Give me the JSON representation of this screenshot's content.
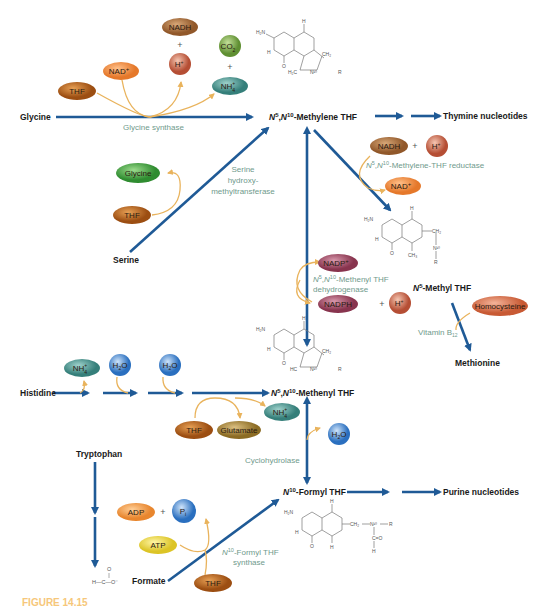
{
  "colors": {
    "main_arrow": "#1f5a96",
    "side_arrow": "#e9b35c",
    "enzyme_text": "#6f9a8c",
    "thf_oval": "#b8641e",
    "nad_oval": "#ee8c3c",
    "h_plus_oval": "#c9674c",
    "nadh_oval": "#a86a38",
    "co2_oval": "#7aa64a",
    "nh4_oval": "#4e9a94",
    "glycine_oval": "#4aaa48",
    "nadp_oval": "#a24a64",
    "homocysteine_oval": "#d9714a",
    "h2o_oval": "#3d86cf",
    "glutamate_oval": "#a8863a",
    "adp_oval": "#ee9a48",
    "atp_oval": "#ecd845",
    "pi_oval": "#3d86cf"
  },
  "compounds": {
    "glycine": "Glycine",
    "serine": "Serine",
    "histidine": "Histidine",
    "tryptophan": "Tryptophan",
    "formate": "Formate",
    "methylene_thf_n5": "N",
    "methylene_thf": "N5,N10-Methylene THF",
    "methylene_thf_label": "-Methylene THF",
    "thymine": "Thymine nucleotides",
    "methyl_thf": "N5-Methyl THF",
    "methyl_thf_label": "-Methyl THF",
    "methenyl_thf": "N5,N10-Methenyl THF",
    "methenyl_thf_label": "-Methenyl THF",
    "formyl_thf": "N10-Formyl THF",
    "formyl_thf_label": "-Formyl THF",
    "purine": "Purine nucleotides",
    "methionine": "Methionine",
    "formate_struct": "H—C—O⁻"
  },
  "enzymes": {
    "glycine_synthase": "Glycine synthase",
    "shmt_1": "Serine",
    "shmt_2": "hydroxy-",
    "shmt_3": "methyltransferase",
    "mthfr": "-Methylene-THF reductase",
    "mthfd_1": "-Methenyl THF",
    "mthfd_2": "dehydrogenase",
    "vitb12": "Vitamin B",
    "vitb12_sub": "12",
    "cyclohydrolase": "Cyclohydrolase",
    "fthfs_1": "-Formyl THF",
    "fthfs_2": "synthase"
  },
  "ovals": {
    "thf": "THF",
    "nad": "NAD",
    "nadh": "NADH",
    "h_plus": "H",
    "co2": "CO",
    "nh4": "NH",
    "glycine": "Glycine",
    "nadp": "NADP",
    "nadph": "NADPH",
    "homocysteine": "Homocysteine",
    "h2o": "H",
    "glutamate": "Glutamate",
    "adp": "ADP",
    "atp": "ATP",
    "pi": "P",
    "plus": "+",
    "sup_plus": "+",
    "sub_2": "2",
    "sub_4": "4",
    "sub_i": "i",
    "h2o_rest": "O"
  },
  "structure_atoms": {
    "h2n": "H₂N",
    "n": "N",
    "h": "H",
    "o": "O",
    "ch2": "CH₂",
    "ch3": "CH₃",
    "r": "R",
    "n5": "N⁵",
    "n10": "N¹⁰",
    "h2c": "H₂C",
    "hc": "HC",
    "c": "C"
  },
  "figure_caption": "FIGURE 14.15"
}
